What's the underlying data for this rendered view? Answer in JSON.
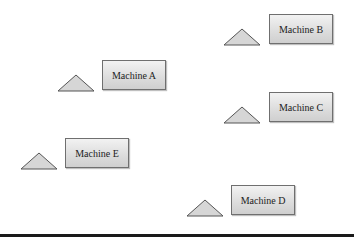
{
  "diagram": {
    "machines": [
      {
        "label": "Machine A",
        "box": {
          "x": 102,
          "y": 60
        },
        "triangle": {
          "x": 57,
          "y": 74
        }
      },
      {
        "label": "Machine B",
        "box": {
          "x": 269,
          "y": 14
        },
        "triangle": {
          "x": 223,
          "y": 28
        }
      },
      {
        "label": "Machine C",
        "box": {
          "x": 269,
          "y": 92
        },
        "triangle": {
          "x": 223,
          "y": 106
        }
      },
      {
        "label": "Machine D",
        "box": {
          "x": 231,
          "y": 185
        },
        "triangle": {
          "x": 186,
          "y": 199
        }
      },
      {
        "label": "Machine E",
        "box": {
          "x": 65,
          "y": 138
        },
        "triangle": {
          "x": 20,
          "y": 152
        }
      }
    ],
    "colors": {
      "box_border": "#6f6f6f",
      "box_fill_top": "#f2f2f2",
      "box_fill_bottom": "#cfcfcf",
      "triangle_fill": "#d6d6d6",
      "floor": "#1a1a1a"
    }
  }
}
